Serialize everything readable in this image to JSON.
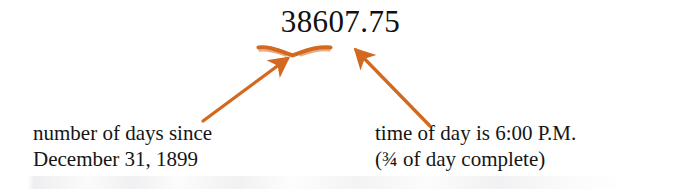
{
  "figure": {
    "kind": "annotated-serial-date-diagram",
    "background_color": "#ffffff",
    "text_color": "#151515",
    "annotation_color": "#D2691E"
  },
  "value": {
    "text": "38607.75",
    "integer_part": "38607",
    "fraction_part": ".75"
  },
  "captions": {
    "left": {
      "line1": "number of days since",
      "line2": "December 31, 1899"
    },
    "right": {
      "line1": "time of day is 6:00 P.M.",
      "line2": "(¾ of day complete)"
    }
  },
  "annotations": {
    "brace_label": "underbrace-under-integer-part",
    "left_arrow_label": "arrow-to-integer-part",
    "right_arrow_label": "arrow-to-fraction-part"
  }
}
